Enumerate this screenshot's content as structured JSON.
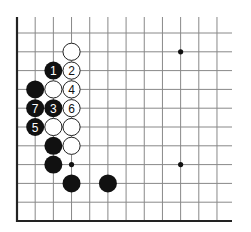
{
  "diagram": {
    "type": "go-board-fragment",
    "colors": {
      "background": "#ffffff",
      "grid": "#888888",
      "edge": "#222222",
      "black": "#111111",
      "white": "#ffffff",
      "stone_outline": "#222222"
    },
    "grid": {
      "x0": 17,
      "dx": 18.18,
      "y0": 33,
      "dy": 18.8,
      "cols": 12,
      "rows": 11,
      "top_extend": 17,
      "right_extend": 232
    },
    "star_points": [
      {
        "col": 9,
        "row": 1
      },
      {
        "col": 9,
        "row": 7
      }
    ],
    "marks": [
      {
        "col": 3,
        "row": 7,
        "type": "small-dot"
      }
    ],
    "stones": [
      {
        "col": 3,
        "row": 1,
        "color": "white",
        "label": ""
      },
      {
        "col": 2,
        "row": 2,
        "color": "black",
        "label": "1"
      },
      {
        "col": 3,
        "row": 2,
        "color": "white",
        "label": "2"
      },
      {
        "col": 1,
        "row": 3,
        "color": "black",
        "label": ""
      },
      {
        "col": 2,
        "row": 3,
        "color": "white",
        "label": ""
      },
      {
        "col": 3,
        "row": 3,
        "color": "white",
        "label": "4"
      },
      {
        "col": 1,
        "row": 4,
        "color": "black",
        "label": "7"
      },
      {
        "col": 2,
        "row": 4,
        "color": "black",
        "label": "3"
      },
      {
        "col": 3,
        "row": 4,
        "color": "white",
        "label": "6"
      },
      {
        "col": 1,
        "row": 5,
        "color": "black",
        "label": "5"
      },
      {
        "col": 2,
        "row": 5,
        "color": "white",
        "label": ""
      },
      {
        "col": 3,
        "row": 5,
        "color": "white",
        "label": ""
      },
      {
        "col": 2,
        "row": 6,
        "color": "black",
        "label": ""
      },
      {
        "col": 3,
        "row": 6,
        "color": "white",
        "label": ""
      },
      {
        "col": 2,
        "row": 7,
        "color": "black",
        "label": ""
      },
      {
        "col": 3,
        "row": 8,
        "color": "black",
        "label": ""
      },
      {
        "col": 5,
        "row": 8,
        "color": "black",
        "label": ""
      }
    ]
  }
}
